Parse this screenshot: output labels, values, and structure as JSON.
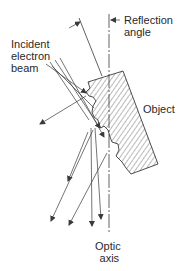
{
  "diagram": {
    "type": "physics-schematic",
    "labels": {
      "incident_beam": [
        "Incident",
        "electron",
        "beam"
      ],
      "reflection_angle": [
        "Reflection",
        "angle"
      ],
      "object": "Object",
      "optic_axis": [
        "Optic",
        "axis"
      ]
    },
    "colors": {
      "line": "#3a3a3a",
      "text": "#2a2a2a",
      "background": "#ffffff"
    }
  }
}
